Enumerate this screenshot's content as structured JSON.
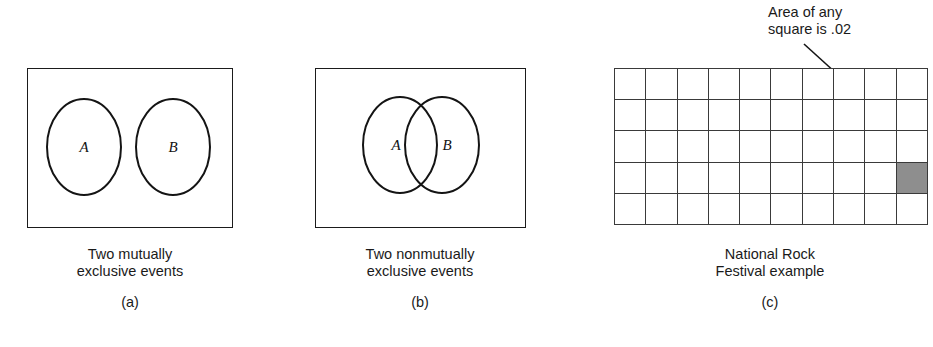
{
  "figure": {
    "panels": [
      {
        "id": "a",
        "letter": "(a)",
        "caption": "Two mutually\nexclusive events",
        "diagram_type": "venn-disjoint",
        "sets": [
          {
            "label": "A"
          },
          {
            "label": "B"
          }
        ]
      },
      {
        "id": "b",
        "letter": "(b)",
        "caption": "Two nonmutually\nexclusive events",
        "diagram_type": "venn-overlapping",
        "sets": [
          {
            "label": "A"
          },
          {
            "label": "B"
          }
        ]
      },
      {
        "id": "c",
        "letter": "(c)",
        "caption": "National Rock\nFestival example",
        "diagram_type": "probability-grid",
        "annotation": "Area of any\nsquare is .02",
        "grid": {
          "columns": 10,
          "rows": 5,
          "total_cells": 50,
          "shaded_cells": 1,
          "shaded_cell_row": 4,
          "shaded_cell_column": 10,
          "cell_area": ".02"
        }
      }
    ]
  },
  "colors": {
    "stroke": "#1b1b1b",
    "grid_line": "#3a3a3a",
    "shaded_fill": "#8e8e8e",
    "background": "#ffffff",
    "text": "#1a1a1a"
  }
}
